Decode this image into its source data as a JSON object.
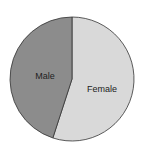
{
  "chart_data": {
    "type": "pie",
    "title": "",
    "labels": [
      "Female",
      "Male"
    ],
    "values": [
      55,
      45
    ],
    "colors": [
      "#d9d9d9",
      "#8c8c8c"
    ],
    "start_angle": "top, clockwise",
    "legend": "none (labels inside slices)"
  }
}
